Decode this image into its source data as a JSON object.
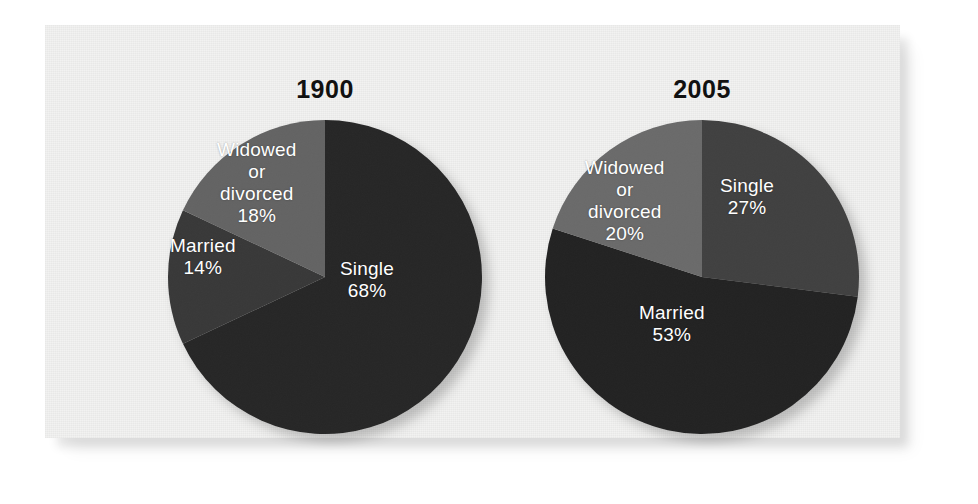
{
  "figure": {
    "background_color": "#ffffff",
    "panel_color": "#f2f2f1"
  },
  "charts": [
    {
      "id": "chart-1900",
      "title": "1900",
      "center": {
        "x": 190,
        "y": 157
      },
      "radius": 157,
      "slices": [
        {
          "name": "single",
          "label": "Single",
          "percent_label": "68%",
          "value": 68,
          "color": "#262626",
          "label_x": 205,
          "label_y": 138
        },
        {
          "name": "married",
          "label": "Married",
          "percent_label": "14%",
          "value": 14,
          "color": "#383838",
          "label_x": 35,
          "label_y": 115
        },
        {
          "name": "widowed-or-divorced",
          "label": "Widowed\nor\ndivorced",
          "percent_label": "18%",
          "value": 18,
          "color": "#636363",
          "label_x": 82,
          "label_y": 19
        }
      ]
    },
    {
      "id": "chart-2005",
      "title": "2005",
      "center": {
        "x": 190,
        "y": 157
      },
      "radius": 157,
      "slices": [
        {
          "name": "single",
          "label": "Single",
          "percent_label": "27%",
          "value": 27,
          "color": "#3f3f3f",
          "label_x": 208,
          "label_y": 55
        },
        {
          "name": "married",
          "label": "Married",
          "percent_label": "53%",
          "value": 53,
          "color": "#232323",
          "label_x": 127,
          "label_y": 182
        },
        {
          "name": "widowed-or-divorced",
          "label": "Widowed\nor\ndivorced",
          "percent_label": "20%",
          "value": 20,
          "color": "#6a6a6a",
          "label_x": 73,
          "label_y": 37
        }
      ]
    }
  ],
  "chart_data": [
    {
      "type": "pie",
      "title": "1900",
      "categories": [
        "Single",
        "Married",
        "Widowed or divorced"
      ],
      "values": [
        68,
        14,
        18
      ],
      "unit": "percent",
      "data_labels": [
        "68%",
        "14%",
        "18%"
      ],
      "colors": [
        "#262626",
        "#383838",
        "#636363"
      ],
      "start_angle_deg": 0,
      "direction": "clockwise",
      "legend": "none",
      "grid": false
    },
    {
      "type": "pie",
      "title": "2005",
      "categories": [
        "Single",
        "Married",
        "Widowed or divorced"
      ],
      "values": [
        27,
        53,
        20
      ],
      "unit": "percent",
      "data_labels": [
        "27%",
        "53%",
        "20%"
      ],
      "colors": [
        "#3f3f3f",
        "#232323",
        "#6a6a6a"
      ],
      "start_angle_deg": 0,
      "direction": "clockwise",
      "legend": "none",
      "grid": false
    }
  ]
}
